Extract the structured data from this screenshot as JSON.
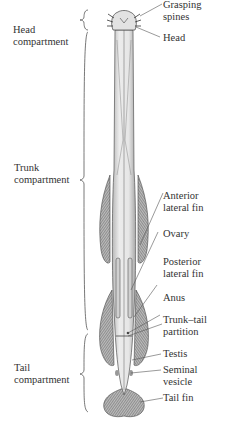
{
  "diagram": {
    "compartments": [
      {
        "label_line1": "Head",
        "label_line2": "compartment"
      },
      {
        "label_line1": "Trunk",
        "label_line2": "compartment"
      },
      {
        "label_line1": "Tail",
        "label_line2": "compartment"
      }
    ],
    "structures": [
      {
        "line1": "Grasping",
        "line2": "spines"
      },
      {
        "line1": "Head",
        "line2": ""
      },
      {
        "line1": "Anterior",
        "line2": "lateral fin"
      },
      {
        "line1": "Ovary",
        "line2": ""
      },
      {
        "line1": "Posterior",
        "line2": "lateral fin"
      },
      {
        "line1": "Anus",
        "line2": ""
      },
      {
        "line1": "Trunk–tail",
        "line2": "partition"
      },
      {
        "line1": "Testis",
        "line2": ""
      },
      {
        "line1": "Seminal",
        "line2": "vesicle"
      },
      {
        "line1": "Tail fin",
        "line2": ""
      }
    ],
    "colors": {
      "ink": "#333333",
      "body_fill": "#e4e4e4",
      "fin_fill": "#8a8a8a",
      "background": "#ffffff"
    }
  }
}
